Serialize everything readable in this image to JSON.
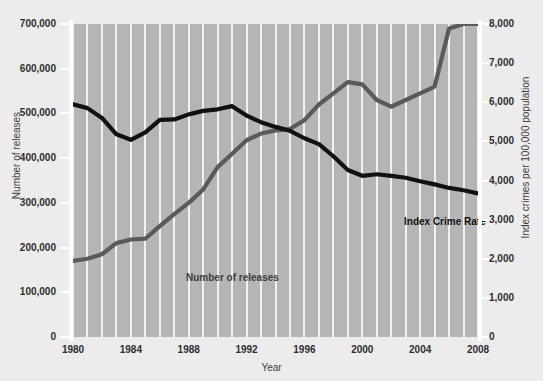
{
  "chart_data": {
    "type": "line",
    "title": "",
    "xlabel": "Year",
    "ylabel": "Number of releases",
    "ylabel_right": "Index crimes per 100,000 population",
    "grid": "vertical-only",
    "legend_position": "inline-annotations",
    "x": [
      1980,
      1981,
      1982,
      1983,
      1984,
      1985,
      1986,
      1987,
      1988,
      1989,
      1990,
      1991,
      1992,
      1993,
      1994,
      1995,
      1996,
      1997,
      1998,
      1999,
      2000,
      2001,
      2002,
      2003,
      2004,
      2005,
      2006,
      2007,
      2008
    ],
    "xlim": [
      1980,
      2008
    ],
    "xticks": [
      1980,
      1984,
      1988,
      1992,
      1996,
      2000,
      2004,
      2008
    ],
    "xticklabels": [
      "1980",
      "1984",
      "1988",
      "1992",
      "1996",
      "2000",
      "2004",
      "2008"
    ],
    "left_axis": {
      "label": "Number of releases",
      "ylim": [
        0,
        700000
      ],
      "ticks": [
        0,
        100000,
        200000,
        300000,
        400000,
        500000,
        600000,
        700000
      ],
      "ticklabels": [
        "0",
        "100,000",
        "200,000",
        "300,000",
        "400,000",
        "500,000",
        "600,000",
        "700,000"
      ]
    },
    "right_axis": {
      "label": "Index crimes per 100,000 population",
      "ylim": [
        0,
        8000
      ],
      "ticks": [
        0,
        1000,
        2000,
        3000,
        4000,
        5000,
        6000,
        7000,
        8000
      ],
      "ticklabels": [
        "0",
        "1,000",
        "2,000",
        "3,000",
        "4,000",
        "5,000",
        "6,000",
        "7,000",
        "8,000"
      ]
    },
    "series": [
      {
        "name": "Index Crime Rate",
        "axis": "right",
        "units": "index crimes per 100,000 population",
        "color": "#111111",
        "annotation": "Index Crime Rate",
        "values": [
          5950,
          5850,
          5600,
          5180,
          5040,
          5230,
          5550,
          5560,
          5690,
          5780,
          5820,
          5900,
          5660,
          5490,
          5370,
          5270,
          5080,
          4930,
          4620,
          4270,
          4120,
          4160,
          4120,
          4070,
          3980,
          3900,
          3810,
          3750,
          3670
        ]
      },
      {
        "name": "Number of releases",
        "axis": "left",
        "units": "releases",
        "color": "#5a5a5a",
        "annotation": "Number of releases",
        "values": [
          170000,
          175000,
          185000,
          210000,
          218000,
          220000,
          248000,
          275000,
          300000,
          330000,
          380000,
          410000,
          440000,
          455000,
          462000,
          465000,
          485000,
          520000,
          545000,
          570000,
          565000,
          530000,
          515000,
          530000,
          545000,
          560000,
          690000,
          700000,
          700000
        ]
      }
    ]
  },
  "annotations": {
    "releases_label": "Number of releases",
    "crime_label": "Index Crime Rate"
  }
}
